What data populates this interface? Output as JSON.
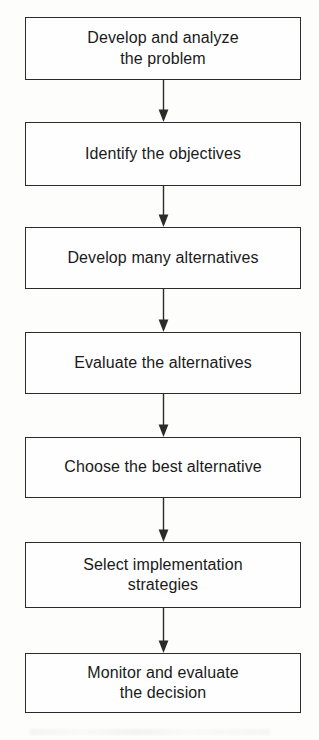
{
  "diagram": {
    "type": "flowchart",
    "orientation": "vertical",
    "colors": {
      "background": "#fdfdfc",
      "box_fill": "#fefefe",
      "box_border": "#2b2b2b",
      "text": "#1a1a1a",
      "arrow": "#2b2b2b"
    },
    "nodes": [
      {
        "id": "step-1",
        "label": "Develop and analyze\nthe problem"
      },
      {
        "id": "step-2",
        "label": "Identify the objectives"
      },
      {
        "id": "step-3",
        "label": "Develop many alternatives"
      },
      {
        "id": "step-4",
        "label": "Evaluate the alternatives"
      },
      {
        "id": "step-5",
        "label": "Choose the best alternative"
      },
      {
        "id": "step-6",
        "label": "Select implementation\nstrategies"
      },
      {
        "id": "step-7",
        "label": "Monitor and evaluate\nthe decision"
      }
    ],
    "connectors": [
      {
        "id": "arrow-1",
        "from": "step-1",
        "to": "step-2",
        "shape": "down-arrow"
      },
      {
        "id": "arrow-2",
        "from": "step-2",
        "to": "step-3",
        "shape": "down-arrow"
      },
      {
        "id": "arrow-3",
        "from": "step-3",
        "to": "step-4",
        "shape": "down-arrow"
      },
      {
        "id": "arrow-4",
        "from": "step-4",
        "to": "step-5",
        "shape": "down-arrow"
      },
      {
        "id": "arrow-5",
        "from": "step-5",
        "to": "step-6",
        "shape": "down-arrow"
      },
      {
        "id": "arrow-6",
        "from": "step-6",
        "to": "step-7",
        "shape": "down-arrow"
      }
    ]
  }
}
